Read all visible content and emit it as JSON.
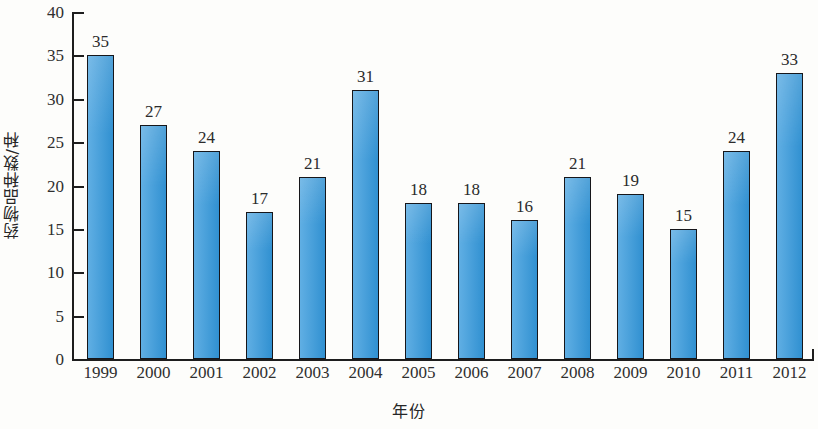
{
  "chart_data": {
    "type": "bar",
    "title": "",
    "xlabel": "年份",
    "ylabel": "药物品种数/种",
    "categories": [
      "1999",
      "2000",
      "2001",
      "2002",
      "2003",
      "2004",
      "2005",
      "2006",
      "2007",
      "2008",
      "2009",
      "2010",
      "2011",
      "2012"
    ],
    "values": [
      35,
      27,
      24,
      17,
      21,
      31,
      18,
      18,
      16,
      21,
      19,
      15,
      24,
      33
    ],
    "data_labels": [
      "35",
      "27",
      "24",
      "17",
      "21",
      "31",
      "18",
      "18",
      "16",
      "21",
      "19",
      "15",
      "24",
      "33"
    ],
    "ylim": [
      0,
      40
    ],
    "ytick_values": [
      0,
      5,
      10,
      15,
      20,
      25,
      30,
      35,
      40
    ],
    "ytick_labels": [
      "0",
      "5",
      "10",
      "15",
      "20",
      "25",
      "30",
      "35",
      "40"
    ],
    "grid": false,
    "legend": false,
    "legend_position": "none",
    "series": [
      {
        "name": "药物品种数",
        "values": [
          35,
          27,
          24,
          17,
          21,
          31,
          18,
          18,
          16,
          21,
          19,
          15,
          24,
          33
        ],
        "color": "#3398dc"
      }
    ],
    "colors": {
      "bar_fill": "#3398dc",
      "bar_edge": "#16161a",
      "axis": "#1d1d1d",
      "text": "#2a2a2a",
      "background": "#fdfdfb"
    }
  }
}
